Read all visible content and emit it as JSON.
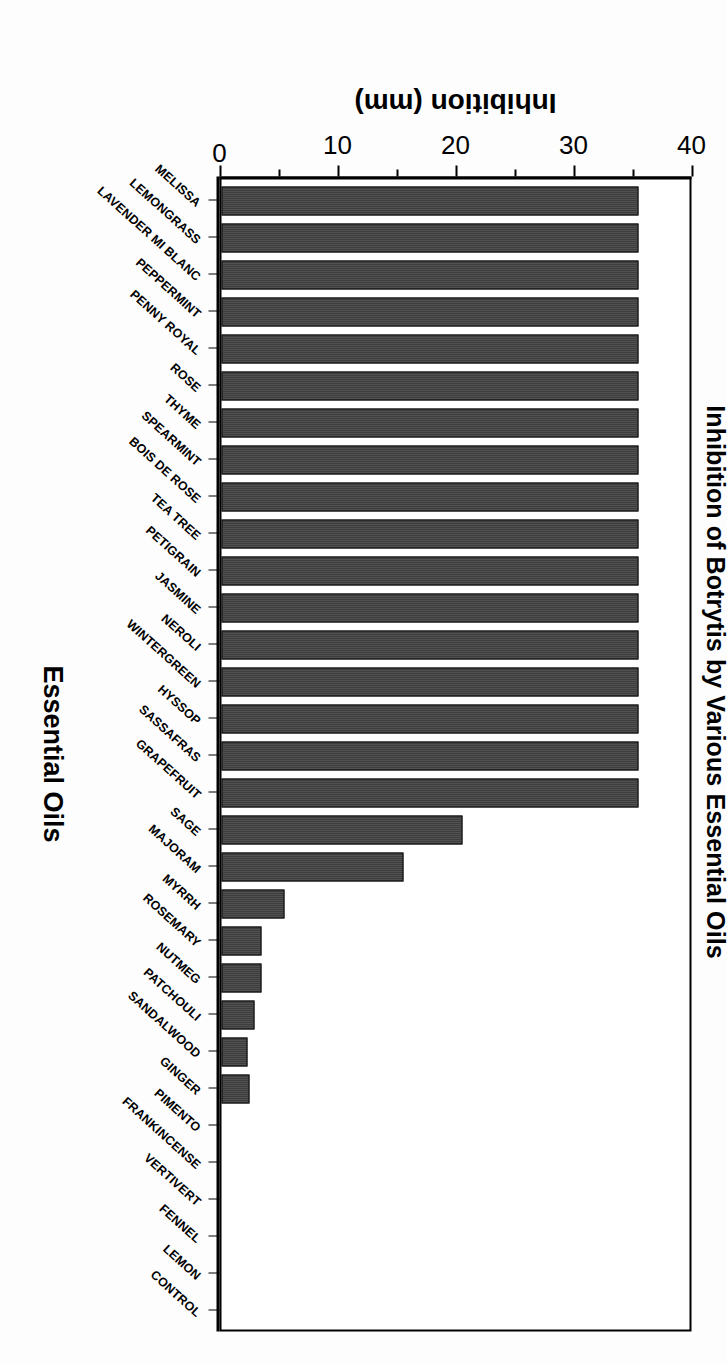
{
  "chart_data": {
    "type": "bar",
    "title": "Inhibition of Botrytis by Various Essential Oils",
    "xlabel": "Essential Oils",
    "ylabel": "Inhibition (mm)",
    "ylim": [
      0,
      40
    ],
    "ytick_labels": [
      "0",
      "10",
      "20",
      "30",
      "40"
    ],
    "ytick_values": [
      0,
      10,
      20,
      30,
      40
    ],
    "yminor_step": 5,
    "grid": false,
    "legend": null,
    "orientation": "vertical-bars-displayed-rotated-90",
    "bar_color": "#333333",
    "categories": [
      "MELISSA",
      "LEMONGRASS",
      "LAVENDER MI BLANC",
      "PEPPERMINT",
      "PENNY ROYAL",
      "ROSE",
      "THYME",
      "SPEARMINT",
      "BOIS DE ROSE",
      "TEA TREE",
      "PETIGRAIN",
      "JASMINE",
      "NEROLI",
      "WINTERGREEN",
      "HYSSOP",
      "SASSAFRAS",
      "GRAPEFRUIT",
      "SAGE",
      "MAJORAM",
      "MYRRH",
      "ROSEMARY",
      "NUTMEG",
      "PATCHOULI",
      "SANDALWOOD",
      "GINGER",
      "PIMENTO",
      "FRANKINCENSE",
      "VERTIVERT",
      "FENNEL",
      "LEMON",
      "CONTROL"
    ],
    "values": [
      35.3,
      35.3,
      35.3,
      35.3,
      35.3,
      35.3,
      35.3,
      35.3,
      35.3,
      35.3,
      35.3,
      35.3,
      35.3,
      35.3,
      35.3,
      35.3,
      35.3,
      20.4,
      15.4,
      5.3,
      3.4,
      3.4,
      2.8,
      2.2,
      2.4,
      0,
      0,
      0,
      0,
      0,
      0
    ]
  }
}
